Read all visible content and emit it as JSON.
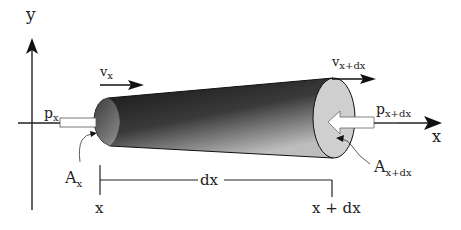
{
  "diagram": {
    "axes": {
      "y_label": "y",
      "x_label": "x"
    },
    "velocity": {
      "left_label": "v",
      "left_sub": "x",
      "right_label": "v",
      "right_sub": "x+dx"
    },
    "pressure": {
      "left_label": "p",
      "left_sub": "x",
      "right_label": "p",
      "right_sub": "x+dx"
    },
    "area": {
      "left_label": "A",
      "left_sub": "x",
      "right_label": "A",
      "right_sub": "x+dx"
    },
    "dimension": {
      "span_label": "dx",
      "start_label": "x",
      "end_label": "x + dx"
    },
    "colors": {
      "cylinder_dark": "#1a1a1a",
      "cylinder_light": "#d0d0d0",
      "end_face": "#cfcfcf",
      "line": "#222222"
    }
  }
}
